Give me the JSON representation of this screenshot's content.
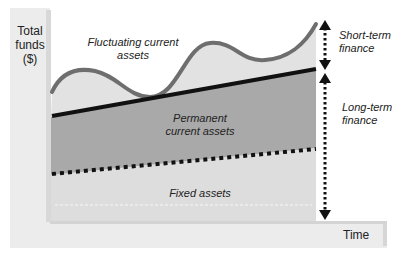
{
  "diagram": {
    "y_axis_label_lines": [
      "Total",
      "funds",
      "($)"
    ],
    "x_axis_label": "Time",
    "regions": {
      "fluctuating": {
        "label_line1": "Fluctuating current",
        "label_line2": "assets"
      },
      "permanent": {
        "label_line1": "Permanent",
        "label_line2": "current assets"
      },
      "fixed": {
        "label": "Fixed assets"
      }
    },
    "annotations": {
      "short_term": {
        "line1": "Short-term",
        "line2": "finance"
      },
      "long_term": {
        "line1": "Long-term",
        "line2": "finance"
      }
    },
    "colors": {
      "background": "#ffffff",
      "axis_fill": "#ececec",
      "fluctuating_fill": "#e2e2e2",
      "permanent_fill": "#a9a9a9",
      "fixed_fill": "#dddddd",
      "curve_stroke": "#6e6e6e",
      "line_stroke": "#111111"
    }
  }
}
